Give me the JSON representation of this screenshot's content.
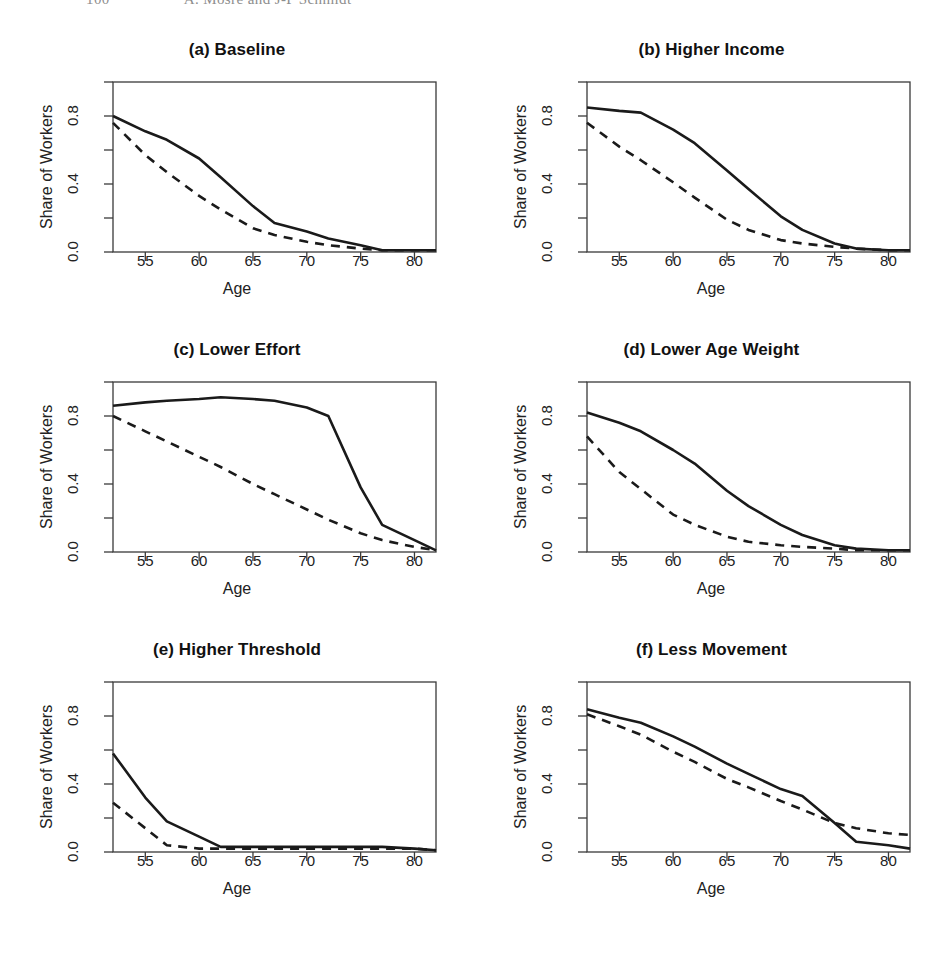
{
  "running_head": {
    "folio": "100",
    "title": "A. Mosre and J-P Schmidt"
  },
  "axes": {
    "ylabel": "Share of Workers",
    "xlabel": "Age",
    "ytick_labels": [
      "0.0",
      "0.4",
      "0.8"
    ],
    "ytick_values": [
      0.0,
      0.4,
      0.8
    ],
    "ytick_marks": [
      0.0,
      0.2,
      0.4,
      0.6,
      0.8,
      1.0
    ],
    "xtick_labels": [
      "55",
      "60",
      "65",
      "70",
      "75",
      "80"
    ],
    "xtick_values": [
      55,
      60,
      65,
      70,
      75,
      80
    ]
  },
  "style": {
    "line_color": "#1a1a1a",
    "box_color": "#3a3a3a",
    "background": "#ffffff",
    "solid_width": 2.6,
    "dashed_width": 2.6,
    "dash_pattern": "9,7"
  },
  "chart_data": [
    {
      "type": "line",
      "id": "a",
      "title": "(a) Baseline",
      "xlabel": "Age",
      "ylabel": "Share of Workers",
      "xlim": [
        52,
        82
      ],
      "ylim": [
        0.0,
        1.0
      ],
      "grid": false,
      "legend": "none",
      "x": [
        52,
        55,
        57,
        60,
        62,
        65,
        67,
        70,
        72,
        75,
        77,
        80,
        82
      ],
      "series": [
        {
          "name": "solid",
          "linestyle": "solid",
          "values": [
            0.8,
            0.71,
            0.66,
            0.55,
            0.44,
            0.27,
            0.17,
            0.12,
            0.08,
            0.04,
            0.01,
            0.01,
            0.01
          ]
        },
        {
          "name": "dashed",
          "linestyle": "dashed",
          "values": [
            0.76,
            0.57,
            0.47,
            0.33,
            0.25,
            0.14,
            0.1,
            0.06,
            0.04,
            0.02,
            0.01,
            0.01,
            0.01
          ]
        }
      ]
    },
    {
      "type": "line",
      "id": "b",
      "title": "(b) Higher Income",
      "xlabel": "Age",
      "ylabel": "Share of Workers",
      "xlim": [
        52,
        82
      ],
      "ylim": [
        0.0,
        1.0
      ],
      "grid": false,
      "legend": "none",
      "x": [
        52,
        55,
        57,
        60,
        62,
        65,
        67,
        70,
        72,
        75,
        77,
        80,
        82
      ],
      "series": [
        {
          "name": "solid",
          "linestyle": "solid",
          "values": [
            0.85,
            0.83,
            0.82,
            0.72,
            0.64,
            0.48,
            0.37,
            0.21,
            0.13,
            0.05,
            0.02,
            0.01,
            0.01
          ]
        },
        {
          "name": "dashed",
          "linestyle": "dashed",
          "values": [
            0.76,
            0.62,
            0.54,
            0.41,
            0.32,
            0.19,
            0.13,
            0.07,
            0.05,
            0.03,
            0.02,
            0.01,
            0.01
          ]
        }
      ]
    },
    {
      "type": "line",
      "id": "c",
      "title": "(c) Lower Effort",
      "xlabel": "Age",
      "ylabel": "Share of Workers",
      "xlim": [
        52,
        82
      ],
      "ylim": [
        0.0,
        1.0
      ],
      "grid": false,
      "legend": "none",
      "x": [
        52,
        55,
        57,
        60,
        62,
        65,
        67,
        70,
        72,
        75,
        77,
        80,
        82
      ],
      "series": [
        {
          "name": "solid",
          "linestyle": "solid",
          "values": [
            0.86,
            0.88,
            0.89,
            0.9,
            0.91,
            0.9,
            0.89,
            0.85,
            0.8,
            0.38,
            0.16,
            0.07,
            0.01
          ]
        },
        {
          "name": "dashed",
          "linestyle": "dashed",
          "values": [
            0.8,
            0.71,
            0.65,
            0.56,
            0.5,
            0.4,
            0.34,
            0.25,
            0.19,
            0.11,
            0.07,
            0.03,
            0.01
          ]
        }
      ]
    },
    {
      "type": "line",
      "id": "d",
      "title": "(d) Lower Age Weight",
      "xlabel": "Age",
      "ylabel": "Share of Workers",
      "xlim": [
        52,
        82
      ],
      "ylim": [
        0.0,
        1.0
      ],
      "grid": false,
      "legend": "none",
      "x": [
        52,
        55,
        57,
        60,
        62,
        65,
        67,
        70,
        72,
        75,
        77,
        80,
        82
      ],
      "series": [
        {
          "name": "solid",
          "linestyle": "solid",
          "values": [
            0.82,
            0.76,
            0.71,
            0.6,
            0.52,
            0.36,
            0.27,
            0.16,
            0.1,
            0.04,
            0.02,
            0.01,
            0.01
          ]
        },
        {
          "name": "dashed",
          "linestyle": "dashed",
          "values": [
            0.68,
            0.47,
            0.37,
            0.22,
            0.16,
            0.09,
            0.06,
            0.04,
            0.03,
            0.02,
            0.01,
            0.01,
            0.01
          ]
        }
      ]
    },
    {
      "type": "line",
      "id": "e",
      "title": "(e) Higher Threshold",
      "xlabel": "Age",
      "ylabel": "Share of Workers",
      "xlim": [
        52,
        82
      ],
      "ylim": [
        0.0,
        1.0
      ],
      "grid": false,
      "legend": "none",
      "x": [
        52,
        55,
        57,
        60,
        62,
        65,
        67,
        70,
        72,
        75,
        77,
        80,
        82
      ],
      "series": [
        {
          "name": "solid",
          "linestyle": "solid",
          "values": [
            0.58,
            0.32,
            0.18,
            0.09,
            0.03,
            0.03,
            0.03,
            0.03,
            0.03,
            0.03,
            0.03,
            0.02,
            0.01
          ]
        },
        {
          "name": "dashed",
          "linestyle": "dashed",
          "values": [
            0.29,
            0.14,
            0.04,
            0.02,
            0.02,
            0.02,
            0.02,
            0.02,
            0.02,
            0.02,
            0.02,
            0.02,
            0.01
          ]
        }
      ]
    },
    {
      "type": "line",
      "id": "f",
      "title": "(f) Less Movement",
      "xlabel": "Age",
      "ylabel": "Share of Workers",
      "xlim": [
        52,
        82
      ],
      "ylim": [
        0.0,
        1.0
      ],
      "grid": false,
      "legend": "none",
      "x": [
        52,
        55,
        57,
        60,
        62,
        65,
        67,
        70,
        72,
        75,
        77,
        80,
        82
      ],
      "series": [
        {
          "name": "solid",
          "linestyle": "solid",
          "values": [
            0.84,
            0.79,
            0.76,
            0.68,
            0.62,
            0.52,
            0.46,
            0.37,
            0.33,
            0.17,
            0.06,
            0.04,
            0.02
          ]
        },
        {
          "name": "dashed",
          "linestyle": "dashed",
          "values": [
            0.81,
            0.74,
            0.69,
            0.59,
            0.53,
            0.43,
            0.38,
            0.3,
            0.25,
            0.17,
            0.14,
            0.11,
            0.1
          ]
        }
      ]
    }
  ]
}
